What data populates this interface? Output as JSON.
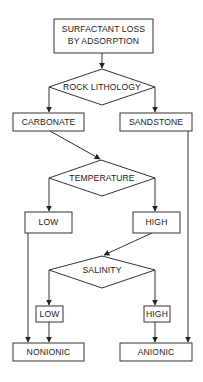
{
  "diagram": {
    "type": "flowchart",
    "nodes": {
      "root": {
        "line1": "SURFACTANT LOSS",
        "line2": "BY ADSORPTION"
      },
      "rock_lithology": {
        "label": "ROCK LITHOLOGY"
      },
      "carbonate": {
        "label": "CARBONATE"
      },
      "sandstone": {
        "label": "SANDSTONE"
      },
      "temperature": {
        "label": "TEMPERATURE"
      },
      "temp_low": {
        "label": "LOW"
      },
      "temp_high": {
        "label": "HIGH"
      },
      "salinity": {
        "label": "SALINITY"
      },
      "sal_low": {
        "label": "LOW"
      },
      "sal_high": {
        "label": "HIGH"
      },
      "nonionic": {
        "label": "NONIONIC"
      },
      "anionic": {
        "label": "ANIONIC"
      }
    },
    "edges": [
      [
        "root",
        "rock_lithology"
      ],
      [
        "rock_lithology",
        "carbonate"
      ],
      [
        "rock_lithology",
        "sandstone"
      ],
      [
        "carbonate",
        "temperature"
      ],
      [
        "sandstone",
        "anionic"
      ],
      [
        "temperature",
        "temp_low"
      ],
      [
        "temperature",
        "temp_high"
      ],
      [
        "temp_low",
        "nonionic"
      ],
      [
        "temp_high",
        "salinity"
      ],
      [
        "salinity",
        "sal_low"
      ],
      [
        "salinity",
        "sal_high"
      ],
      [
        "sal_low",
        "nonionic"
      ],
      [
        "sal_high",
        "anionic"
      ]
    ],
    "colors": {
      "stroke": "#333333",
      "text": "#222222",
      "background": "#ffffff"
    }
  }
}
